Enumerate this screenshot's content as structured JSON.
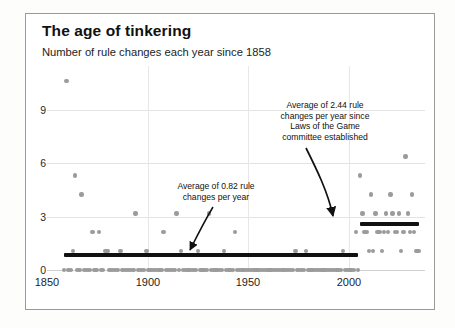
{
  "chart_data": {
    "type": "scatter",
    "title": "The age of tinkering",
    "subtitle": "Number of rule changes each year since 1858",
    "xlabel": "",
    "ylabel": "",
    "xlim": [
      1850,
      2025
    ],
    "ylim": [
      0,
      10.8
    ],
    "grid": true,
    "legend": "none",
    "xticks": [
      1850,
      1900,
      1950,
      2000
    ],
    "yticks": [
      0,
      3,
      6,
      9
    ],
    "series": [
      {
        "name": "Rule changes per year",
        "marker": "circle",
        "color": "#9b9b9b",
        "x": [
          1858,
          1859,
          1860,
          1861,
          1862,
          1863,
          1864,
          1865,
          1866,
          1867,
          1868,
          1869,
          1870,
          1871,
          1872,
          1873,
          1874,
          1875,
          1876,
          1877,
          1878,
          1879,
          1880,
          1881,
          1882,
          1883,
          1884,
          1885,
          1886,
          1887,
          1888,
          1889,
          1890,
          1891,
          1892,
          1893,
          1894,
          1895,
          1896,
          1897,
          1898,
          1899,
          1900,
          1901,
          1902,
          1903,
          1904,
          1905,
          1906,
          1907,
          1908,
          1909,
          1910,
          1911,
          1912,
          1913,
          1914,
          1915,
          1916,
          1917,
          1918,
          1919,
          1920,
          1921,
          1922,
          1923,
          1924,
          1925,
          1926,
          1927,
          1928,
          1929,
          1930,
          1931,
          1932,
          1933,
          1934,
          1935,
          1936,
          1937,
          1938,
          1939,
          1940,
          1941,
          1942,
          1943,
          1944,
          1945,
          1946,
          1947,
          1948,
          1949,
          1950,
          1951,
          1952,
          1953,
          1954,
          1955,
          1956,
          1957,
          1958,
          1959,
          1960,
          1961,
          1962,
          1963,
          1964,
          1965,
          1966,
          1967,
          1968,
          1969,
          1970,
          1971,
          1972,
          1973,
          1974,
          1975,
          1976,
          1977,
          1978,
          1979,
          1980,
          1981,
          1982,
          1983,
          1984,
          1985,
          1986,
          1987,
          1988,
          1989,
          1990,
          1991,
          1992,
          1993,
          1994,
          1995,
          1996,
          1997,
          1998,
          1999,
          2000,
          2001,
          2002,
          2003,
          2004,
          2005,
          2006,
          2007,
          2008,
          2009,
          2010,
          2011,
          2012,
          2013,
          2014,
          2015,
          2016,
          2017,
          2018,
          2019,
          2020,
          2021,
          2022
        ],
        "y": [
          0,
          10,
          0,
          0,
          1,
          5,
          0,
          0,
          4,
          0,
          0,
          0,
          0,
          2,
          0,
          0,
          2,
          0,
          0,
          1,
          1,
          0,
          0,
          0,
          0,
          0,
          1,
          0,
          0,
          0,
          0,
          0,
          0,
          3,
          0,
          0,
          0,
          0,
          1,
          0,
          0,
          0,
          0,
          0,
          0,
          0,
          2,
          0,
          0,
          0,
          0,
          0,
          3,
          0,
          1,
          0,
          0,
          0,
          0,
          0,
          0,
          0,
          1,
          0,
          0,
          0,
          0,
          3,
          0,
          0,
          0,
          0,
          0,
          0,
          1,
          0,
          0,
          0,
          0,
          2,
          0,
          0,
          0,
          0,
          0,
          0,
          0,
          0,
          0,
          0,
          0,
          0,
          0,
          0,
          0,
          0,
          0,
          0,
          0,
          0,
          0,
          0,
          0,
          0,
          0,
          0,
          0,
          1,
          0,
          0,
          0,
          0,
          1,
          0,
          0,
          0,
          0,
          0,
          0,
          0,
          0,
          0,
          0,
          0,
          0,
          0,
          0,
          0,
          0,
          1,
          0,
          0,
          0,
          0,
          0,
          2,
          0,
          5,
          3,
          2,
          2,
          1,
          4,
          1,
          3,
          2,
          2,
          1,
          2,
          3,
          2,
          4,
          3,
          2,
          2,
          3,
          1,
          2,
          6,
          3,
          2,
          4,
          2,
          1,
          1
        ]
      }
    ],
    "reference_lines": [
      {
        "name": "average-before-1995",
        "label": "Average of 0.82 rule changes per year",
        "value": 0.82,
        "x_start": 1858,
        "x_end": 1994,
        "color": "#111111"
      },
      {
        "name": "average-after-1995",
        "label": "Average of 2.44 rule changes per year since Laws of the Game committee established",
        "value": 2.44,
        "x_start": 1995,
        "x_end": 2022,
        "color": "#111111"
      }
    ],
    "annotations": [
      {
        "name": "annotation-left",
        "lines": [
          "Average of 0.82 rule",
          "changes per year"
        ],
        "text": "Average of 0.82 rule\nchanges per year"
      },
      {
        "name": "annotation-right",
        "lines": [
          "Average of 2.44 rule",
          "changes per year since",
          "Laws of the Game",
          "committee established"
        ],
        "text": "Average of 2.44 rule\nchanges per year since\nLaws of the Game\ncommittee established"
      }
    ]
  },
  "colors": {
    "dot": "#9b9b9b",
    "line": "#111111",
    "grid": "#e3e3e3",
    "border": "#9a9a9a",
    "text": "#111111"
  },
  "axis": {
    "x_labels": [
      "1850",
      "1900",
      "1950",
      "2000"
    ],
    "y_labels": [
      "0",
      "3",
      "6",
      "9"
    ]
  }
}
